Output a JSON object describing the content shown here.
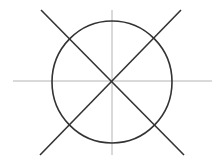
{
  "diagram": {
    "colors": {
      "background": "#ffffff",
      "axis": "#b4b4b4",
      "stroke": "#333333"
    },
    "center": {
      "x": 112,
      "y": 81
    },
    "axes": {
      "horizontal": {
        "x1": 13,
        "y1": 81,
        "x2": 212,
        "y2": 81
      },
      "vertical": {
        "x1": 112,
        "y1": 10,
        "x2": 112,
        "y2": 155
      }
    },
    "circle": {
      "cx": 112,
      "cy": 82,
      "rx": 60,
      "ry": 61
    },
    "diagonals": [
      {
        "x1": 41,
        "y1": 10,
        "x2": 184,
        "y2": 155
      },
      {
        "x1": 181,
        "y1": 10,
        "x2": 40,
        "y2": 155
      }
    ]
  }
}
